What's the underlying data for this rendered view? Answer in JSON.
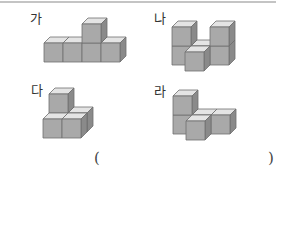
{
  "figures": [
    {
      "label": "가",
      "cubes": [
        [
          0,
          0,
          0
        ],
        [
          1,
          0,
          0
        ],
        [
          2,
          0,
          0
        ],
        [
          3,
          0,
          0
        ],
        [
          2,
          0,
          1
        ]
      ]
    },
    {
      "label": "나",
      "cubes": [
        [
          0,
          1,
          0
        ],
        [
          0,
          1,
          1
        ],
        [
          1,
          1,
          0
        ],
        [
          2,
          1,
          0
        ],
        [
          2,
          1,
          1
        ],
        [
          1,
          0,
          0
        ]
      ]
    },
    {
      "label": "다",
      "cubes": [
        [
          0,
          1,
          0
        ],
        [
          0,
          1,
          1
        ],
        [
          0,
          0,
          0
        ],
        [
          1,
          0,
          0
        ],
        [
          1,
          1,
          0
        ]
      ]
    },
    {
      "label": "라",
      "cubes": [
        [
          0,
          1,
          0
        ],
        [
          0,
          1,
          1
        ],
        [
          1,
          1,
          0
        ],
        [
          2,
          1,
          0
        ],
        [
          1,
          0,
          0
        ]
      ]
    }
  ],
  "answer": {
    "open": "(",
    "close": ")",
    "value": ""
  },
  "colors": {
    "top": "#e4e4e4",
    "front": "#a9a9a9",
    "side": "#8a8a8a",
    "edge": "#6e6e6e"
  }
}
